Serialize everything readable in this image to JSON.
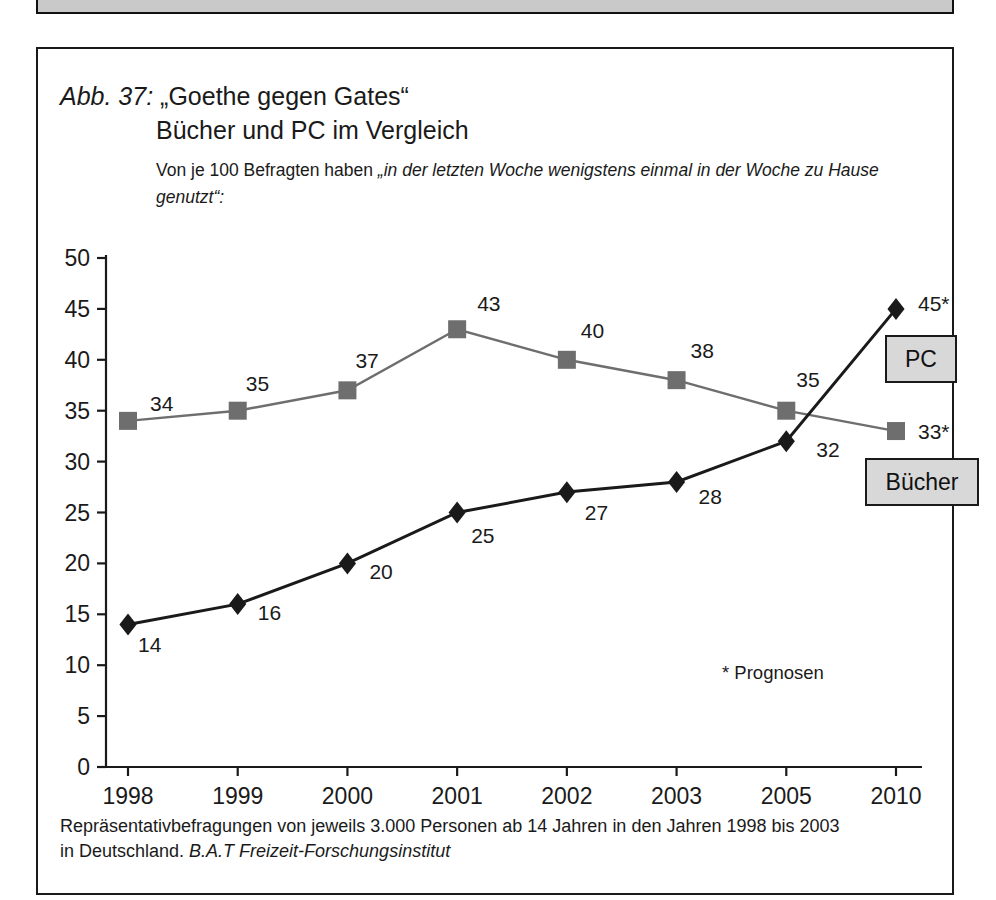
{
  "figure": {
    "label_prefix": "Abb. 37:",
    "title_quoted": "„Goethe gegen Gates“",
    "title_line2": "Bücher und PC im Vergleich",
    "subtitle_lead": "Von je 100 Befragten haben ",
    "subtitle_quoted": "„in der letzten Woche wenigstens einmal in der Woche zu Hause genutzt“:",
    "footnote": "* Prognosen",
    "source_line1": "Repräsentativbefragungen von jeweils 3.000 Personen ab 14 Jahren in den Jahren 1998 bis 2003",
    "source_line2_plain": "in Deutschland. ",
    "source_line2_italic": "B.A.T Freizeit-Forschungsinstitut"
  },
  "legend": {
    "pc_label": "PC",
    "buecher_label": "Bücher"
  },
  "colors": {
    "pc_series": "#6e6e6e",
    "buecher_series": "#1a1a1a",
    "legend_fill": "#d8d8d8",
    "frame": "#1a1a1a",
    "top_bar": "#c9c9c9"
  },
  "chart_data": {
    "type": "line",
    "subtitle": "Von je 100 Befragten haben „in der letzten Woche wenigstens einmal in der Woche zu Hause genutzt“:",
    "xlabel": "",
    "ylabel": "",
    "categories": [
      "1998",
      "1999",
      "2000",
      "2001",
      "2002",
      "2003",
      "2005",
      "2010"
    ],
    "ylim": [
      0,
      50
    ],
    "ytick_step": 5,
    "yticks": [
      "0",
      "5",
      "10",
      "15",
      "20",
      "25",
      "30",
      "35",
      "40",
      "45",
      "50"
    ],
    "grid": false,
    "legend_position": "right",
    "annotation": "* Prognosen",
    "series": [
      {
        "name": "PC",
        "color": "#6e6e6e",
        "marker": "square",
        "values": [
          34,
          35,
          37,
          43,
          40,
          38,
          35,
          33
        ],
        "point_labels": [
          "34",
          "35",
          "37",
          "43",
          "40",
          "38",
          "35",
          "33*"
        ],
        "forecast_from_index": 7
      },
      {
        "name": "Bücher",
        "color": "#1a1a1a",
        "marker": "diamond",
        "values": [
          14,
          16,
          20,
          25,
          27,
          28,
          32,
          45
        ],
        "point_labels": [
          "14",
          "16",
          "20",
          "25",
          "27",
          "28",
          "32",
          "45*"
        ],
        "forecast_from_index": 7
      }
    ]
  }
}
